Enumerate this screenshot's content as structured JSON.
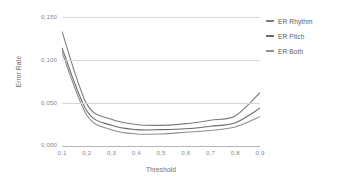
{
  "chart_data": {
    "type": "line",
    "title": "",
    "xlabel": "Threshold",
    "ylabel": "Error Rate",
    "x": [
      0.1,
      0.2,
      0.3,
      0.4,
      0.5,
      0.6,
      0.7,
      0.8,
      0.9
    ],
    "categories": [
      "0,1",
      "0,2",
      "0,3",
      "0,4",
      "0,5",
      "0,6",
      "0,7",
      "0,8",
      "0,9"
    ],
    "xlim": [
      0.1,
      0.9
    ],
    "ylim": [
      0.0,
      0.15
    ],
    "yticks": [
      0.0,
      0.05,
      0.1,
      0.15
    ],
    "ytick_labels": [
      "0,000",
      "0,050",
      "0,100",
      "0,150"
    ],
    "grid": true,
    "legend_position": "right",
    "series": [
      {
        "name": "ER Rhythm",
        "color": "#7d7d7d",
        "values": [
          0.133,
          0.049,
          0.031,
          0.025,
          0.024,
          0.026,
          0.03,
          0.035,
          0.062
        ]
      },
      {
        "name": "ER Pitch",
        "color": "#6a6a6a",
        "values": [
          0.114,
          0.041,
          0.024,
          0.019,
          0.019,
          0.02,
          0.023,
          0.027,
          0.044
        ]
      },
      {
        "name": "ER Both",
        "color": "#8e8e8e",
        "values": [
          0.109,
          0.036,
          0.019,
          0.014,
          0.014,
          0.016,
          0.018,
          0.022,
          0.034
        ]
      }
    ]
  },
  "axes": {
    "ylabel": "Error Rate",
    "xlabel": "Threshold",
    "ytick_labels": [
      "0,150",
      "0,100",
      "0,050",
      "0,000"
    ],
    "xtick_labels": [
      "0,1",
      "0,2",
      "0,3",
      "0,4",
      "0,5",
      "0,6",
      "0,7",
      "0,8",
      "0,9"
    ]
  },
  "legend": {
    "items": [
      {
        "label": "ER Rhythm",
        "color": "#7d7d7d"
      },
      {
        "label": "ER Pitch",
        "color": "#6a6a6a"
      },
      {
        "label": "ER Both",
        "color": "#8e8e8e"
      }
    ]
  },
  "colors": {
    "grid": "#d6d6d6",
    "baseline": "#b4b4b4",
    "tick_text": "#8a8a8a",
    "axis_title": "#6e6e6e",
    "legend_text": "#5c5c5c",
    "background": "#ffffff"
  }
}
